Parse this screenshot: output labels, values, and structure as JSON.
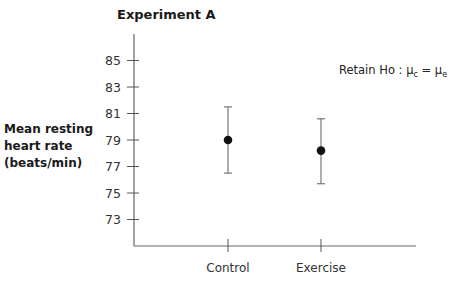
{
  "chart_data": {
    "type": "scatter",
    "title": "Experiment A",
    "xlabel": "",
    "ylabel": "Mean resting heart rate (beats/min)",
    "ylabel_lines": [
      "Mean resting",
      "heart rate",
      "(beats/min)"
    ],
    "categories": [
      "Control",
      "Exercise"
    ],
    "yticks": [
      73,
      75,
      77,
      79,
      81,
      83,
      85
    ],
    "ylim": [
      71,
      87
    ],
    "grid": false,
    "legend": null,
    "series": [
      {
        "name": "Mean with error bars",
        "values": [
          79.0,
          78.2
        ],
        "error_upper": [
          81.5,
          80.6
        ],
        "error_lower": [
          76.5,
          75.7
        ]
      }
    ],
    "annotations": [
      {
        "text": "Retain Ho : μc = μe",
        "parts": {
          "prefix": "Retain Ho : ",
          "mu1": "μ",
          "sub1": "c",
          "eq": " = ",
          "mu2": "μ",
          "sub2": "e"
        }
      }
    ]
  }
}
